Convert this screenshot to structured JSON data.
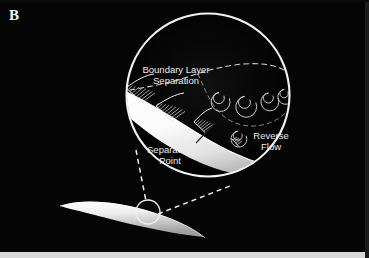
{
  "figure": {
    "panel_label": "B",
    "background_color": "#050505",
    "border_color": "#c9c9c9",
    "ink_color": "#e9e9e9",
    "surface_color": "#ffffff"
  },
  "annotations": {
    "boundary_layer": {
      "line1": "Boundary Layer",
      "line2": "Separation",
      "x": 176,
      "y": 73
    },
    "separation_point": {
      "line1": "Separation",
      "line2": "Point",
      "x": 170,
      "y": 153
    },
    "reverse_flow": {
      "line1": "Reverse",
      "line2": "Flow",
      "x": 271,
      "y": 139
    }
  },
  "magnifier": {
    "center_x": 208,
    "center_y": 95,
    "radius": 82,
    "stroke_color": "#f2f2f2"
  },
  "detail_circle": {
    "center_x": 148,
    "center_y": 212,
    "radius": 12,
    "stroke_color": "#f2f2f2"
  },
  "callout_lines": [
    {
      "name": "upper-leader",
      "x1": 136,
      "y1": 150,
      "x2": 146,
      "y2": 201
    },
    {
      "name": "lower-leader",
      "x1": 157,
      "y1": 214,
      "x2": 228,
      "y2": 186
    }
  ],
  "features": [
    {
      "name": "attached-boundary-layer-profiles",
      "count": 3
    },
    {
      "name": "separated-shear-layer",
      "style": "dashed"
    },
    {
      "name": "recirculation-vortices",
      "count": 4
    },
    {
      "name": "reverse-flow-curl",
      "count": 1
    }
  ]
}
